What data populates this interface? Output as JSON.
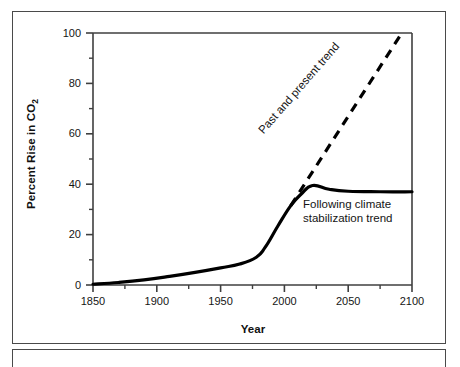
{
  "chart_data": {
    "type": "line",
    "title": "",
    "xlabel": "Year",
    "ylabel": "Percent Rise in CO2",
    "ylabel_base": "Percent Rise in CO",
    "ylabel_sub": "2",
    "xlim": [
      1850,
      2100
    ],
    "ylim": [
      0,
      100
    ],
    "xticks": [
      1850,
      1900,
      1950,
      2000,
      2050,
      2100
    ],
    "xtick_labels": [
      "1850",
      "1900",
      "1950",
      "2000",
      "2050",
      "2100"
    ],
    "xminor_ticks": [
      1875,
      1925,
      1975,
      2025,
      2075
    ],
    "yticks": [
      0,
      20,
      40,
      60,
      80,
      100
    ],
    "ytick_labels": [
      "0",
      "20",
      "40",
      "60",
      "80",
      "100"
    ],
    "yminor_ticks": [
      10,
      30,
      50,
      70,
      90
    ],
    "grid": false,
    "legend_position": "inline-annotations",
    "series": [
      {
        "name": "Following climate stabilization trend",
        "style": "solid",
        "color": "#000000",
        "linewidth": 3.2,
        "points": [
          [
            1850,
            0.3
          ],
          [
            1870,
            1.0
          ],
          [
            1890,
            2.0
          ],
          [
            1910,
            3.4
          ],
          [
            1930,
            5.0
          ],
          [
            1950,
            6.8
          ],
          [
            1965,
            8.3
          ],
          [
            1978,
            11.0
          ],
          [
            1985,
            15.0
          ],
          [
            1995,
            23.5
          ],
          [
            2005,
            31.5
          ],
          [
            2013,
            36.0
          ],
          [
            2022,
            39.5
          ],
          [
            2035,
            38.0
          ],
          [
            2050,
            37.2
          ],
          [
            2075,
            37.0
          ],
          [
            2100,
            37.0
          ]
        ]
      },
      {
        "name": "Past and present trend",
        "style": "dashed",
        "color": "#000000",
        "linewidth": 3.2,
        "dash_pattern": "9 7",
        "points": [
          [
            2005,
            31.5
          ],
          [
            2092,
            100
          ]
        ]
      }
    ],
    "annotations": [
      {
        "name": "past-and-present-trend-label",
        "text": "Past and present trend",
        "rotation": -49,
        "x": 2032,
        "y": 63
      },
      {
        "name": "following-climate-stabilization-trend-label",
        "line1": "Following climate",
        "line2": "stabilization trend",
        "rotation": 0,
        "x": 2035,
        "y": 35
      }
    ]
  },
  "axes": {
    "y_title": "Percent Rise in CO",
    "y_title_sub": "2",
    "x_title": "Year"
  },
  "colors": {
    "line": "#000000",
    "axis": "#3f3f3f",
    "frame": "#4a4a4a",
    "text": "#141414",
    "background": "#ffffff"
  }
}
